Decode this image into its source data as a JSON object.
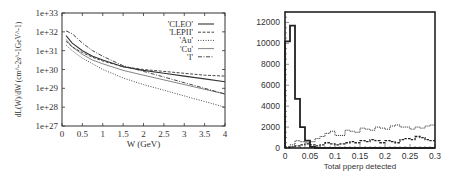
{
  "chart_data": [
    {
      "type": "line",
      "title": "",
      "xlabel": "W (GeV)",
      "ylabel": "dL(W)/dW (cm^-2s^-1GeV^-1)",
      "xlim": [
        0,
        4
      ],
      "ylim": [
        1e+27,
        1e+33
      ],
      "yscale": "log",
      "grid": false,
      "legend_position": "upper right",
      "x_ticks": [
        "0",
        "0.5",
        "1",
        "1.5",
        "2",
        "2.5",
        "3",
        "3.5",
        "4"
      ],
      "y_ticks": [
        "1e+27",
        "1e+28",
        "1e+29",
        "1e+30",
        "1e+31",
        "1e+32",
        "1e+33"
      ],
      "x": [
        0.1,
        0.25,
        0.5,
        0.75,
        1.0,
        1.5,
        2.0,
        2.5,
        3.0,
        3.5,
        4.0
      ],
      "series": [
        {
          "name": "'CLEO'",
          "style": "solid",
          "log10_values": [
            31.8,
            31.4,
            31.0,
            30.7,
            30.5,
            30.15,
            29.95,
            29.8,
            29.65,
            29.5,
            29.35
          ]
        },
        {
          "name": "'LEPII'",
          "style": "dashed",
          "log10_values": [
            31.5,
            31.2,
            30.9,
            30.65,
            30.45,
            30.15,
            30.0,
            29.9,
            29.8,
            29.7,
            29.65
          ]
        },
        {
          "name": "'Au'",
          "style": "dotted",
          "log10_values": [
            31.3,
            31.0,
            30.6,
            30.3,
            30.0,
            29.55,
            29.2,
            28.9,
            28.6,
            28.3,
            28.0
          ]
        },
        {
          "name": "'Cu'",
          "style": "thin-solid",
          "log10_values": [
            31.6,
            31.2,
            30.8,
            30.5,
            30.3,
            29.95,
            29.7,
            29.45,
            29.2,
            28.95,
            28.7
          ]
        },
        {
          "name": "'I'",
          "style": "dash-dot",
          "log10_values": [
            32.05,
            31.9,
            31.4,
            31.0,
            30.7,
            30.2,
            29.9,
            29.6,
            29.3,
            29.0,
            28.7
          ]
        }
      ]
    },
    {
      "type": "bar",
      "subtype": "histogram",
      "title": "",
      "xlabel": "Total pperp detected",
      "ylabel": "",
      "xlim": [
        0,
        0.3
      ],
      "ylim": [
        0,
        13000
      ],
      "grid": false,
      "x_ticks": [
        "0",
        "0.05",
        "0.1",
        "0.15",
        "0.2",
        "0.25",
        "0.3"
      ],
      "y_ticks": [
        "0",
        "2000",
        "4000",
        "6000",
        "8000",
        "10000",
        "12000"
      ],
      "bin_width": 0.01,
      "bin_edges": [
        0,
        0.01,
        0.02,
        0.03,
        0.04,
        0.05,
        0.06,
        0.07,
        0.08,
        0.09,
        0.1,
        0.11,
        0.12,
        0.13,
        0.14,
        0.15,
        0.16,
        0.17,
        0.18,
        0.19,
        0.2,
        0.21,
        0.22,
        0.23,
        0.24,
        0.25,
        0.26,
        0.27,
        0.28,
        0.29,
        0.3
      ],
      "series": [
        {
          "name": "solid",
          "style": "thick-solid",
          "values": [
            10200,
            11700,
            4700,
            2000,
            700,
            100,
            0,
            0,
            0,
            0,
            0,
            0,
            0,
            0,
            0,
            0,
            0,
            0,
            0,
            0,
            0,
            0,
            0,
            0,
            0,
            0,
            0,
            0,
            0,
            0
          ]
        },
        {
          "name": "dotted",
          "style": "dotted",
          "values": [
            100,
            300,
            700,
            600,
            500,
            600,
            900,
            1100,
            1400,
            1600,
            1200,
            1200,
            1700,
            1600,
            1500,
            1900,
            1800,
            1700,
            2000,
            1900,
            1800,
            2100,
            2200,
            2000,
            2000,
            1800,
            2000,
            1900,
            2100,
            2200
          ]
        },
        {
          "name": "dashed",
          "style": "dashed",
          "values": [
            50,
            100,
            200,
            300,
            400,
            300,
            200,
            300,
            500,
            400,
            300,
            400,
            500,
            600,
            500,
            700,
            600,
            800,
            700,
            500,
            700,
            600,
            500,
            800,
            900,
            800,
            1100,
            1000,
            800,
            700
          ]
        }
      ]
    }
  ]
}
